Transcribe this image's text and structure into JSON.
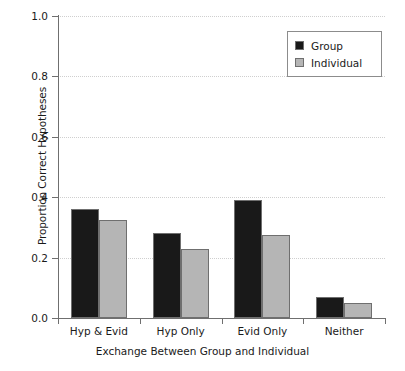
{
  "chart_data": {
    "type": "bar",
    "title": "",
    "xlabel": "Exchange Between Group and Individual",
    "ylabel": "Proportion Correct Hypotheses",
    "categories": [
      "Hyp & Evid",
      "Hyp Only",
      "Evid Only",
      "Neither"
    ],
    "series": [
      {
        "name": "Group",
        "color": "#191919",
        "values": [
          0.36,
          0.28,
          0.39,
          0.07
        ]
      },
      {
        "name": "Individual",
        "color": "#b5b5b5",
        "values": [
          0.325,
          0.228,
          0.275,
          0.05
        ]
      }
    ],
    "ylim": [
      0.0,
      1.0
    ],
    "yticks": [
      0.0,
      0.2,
      0.4,
      0.6,
      0.8,
      1.0
    ],
    "ytick_labels": [
      "0.0",
      "0.2",
      "0.4",
      "0.6",
      "0.8",
      "1.0"
    ],
    "grid": "horizontal-dotted",
    "legend_position": "top-right"
  },
  "legend": {
    "entries": [
      {
        "label": "Group",
        "swatch": "black-square-swatch"
      },
      {
        "label": "Individual",
        "swatch": "gray-square-swatch"
      }
    ]
  },
  "axes": {
    "y_title": "Proportion Correct Hypotheses",
    "x_title": "Exchange Between Group and Individual"
  }
}
